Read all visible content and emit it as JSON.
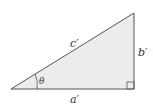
{
  "diagram": {
    "type": "right-triangle",
    "labels": {
      "hypotenuse": "c′",
      "opposite": "b′",
      "adjacent": "a′",
      "angle": "θ"
    },
    "colors": {
      "fill": "#ececec",
      "stroke": "#555555",
      "text": "#333333"
    }
  }
}
